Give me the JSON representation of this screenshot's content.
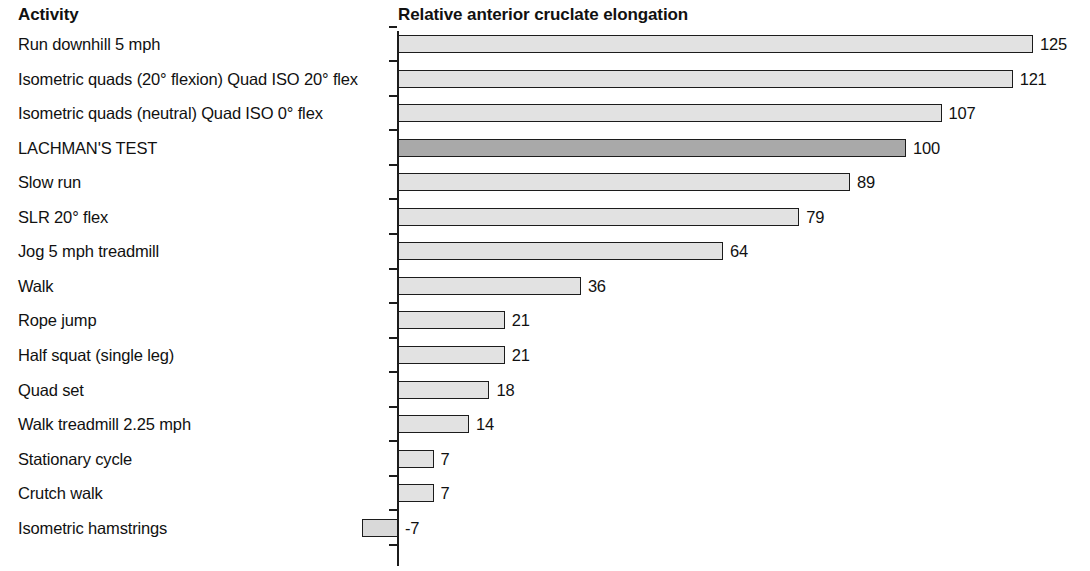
{
  "headers": {
    "activity": "Activity",
    "value": "Relative anterior cruclate elongation"
  },
  "chart_data": {
    "type": "bar",
    "orientation": "horizontal",
    "title": "Relative anterior cruclate elongation",
    "xlabel": "Relative anterior cruclate elongation",
    "ylabel": "Activity",
    "grid": false,
    "legend": false,
    "xlim": [
      -7,
      125
    ],
    "baseline": 0,
    "colors": {
      "bar_fill": "#e2e2e2",
      "bar_fill_highlight": "#a9a9a9",
      "bar_stroke": "#1c1c1c",
      "text": "#111111"
    },
    "categories": [
      "Run downhill 5 mph",
      "Isometric quads (20° flexion) Quad ISO 20° flex",
      "Isometric quads (neutral) Quad ISO 0° flex",
      "LACHMAN'S TEST",
      "Slow run",
      "SLR 20° flex",
      "Jog 5 mph treadmill",
      "Walk",
      "Rope jump",
      "Half squat (single leg)",
      "Quad set",
      "Walk treadmill 2.25 mph",
      "Stationary cycle",
      "Crutch walk",
      "Isometric hamstrings"
    ],
    "values": [
      125,
      121,
      107,
      100,
      89,
      79,
      64,
      36,
      21,
      21,
      18,
      14,
      7,
      7,
      -7
    ],
    "value_labels": [
      "125",
      "121",
      "107",
      "100",
      "89",
      "79",
      "64",
      "36",
      "21",
      "21",
      "18",
      "14",
      "7",
      "7",
      "-7"
    ],
    "highlighted": [
      "LACHMAN'S TEST"
    ]
  }
}
